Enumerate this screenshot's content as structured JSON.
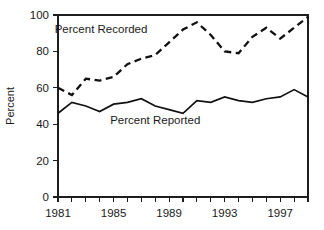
{
  "chart_data": {
    "type": "line",
    "title": "",
    "xlabel": "",
    "ylabel": "Percent",
    "xlim": [
      1981,
      1999
    ],
    "ylim": [
      0,
      100
    ],
    "grid": false,
    "legend_position": "inline-annotation",
    "x": [
      1981,
      1982,
      1983,
      1984,
      1985,
      1986,
      1987,
      1988,
      1989,
      1990,
      1991,
      1992,
      1993,
      1994,
      1995,
      1996,
      1997,
      1998,
      1999
    ],
    "y_ticks": [
      0,
      20,
      40,
      60,
      80,
      100
    ],
    "y_tick_labels": [
      "0",
      "20",
      "40",
      "60",
      "80",
      "100"
    ],
    "x_ticks": [
      1981,
      1982,
      1983,
      1984,
      1985,
      1986,
      1987,
      1988,
      1989,
      1990,
      1991,
      1992,
      1993,
      1994,
      1995,
      1996,
      1997,
      1998,
      1999
    ],
    "x_tick_labels": [
      "1981",
      "1985",
      "1989",
      "1993",
      "1997"
    ],
    "x_labeled_ticks": [
      1981,
      1985,
      1989,
      1993,
      1997
    ],
    "series": [
      {
        "name": "Percent Recorded",
        "style": "dashed",
        "color": "#111111",
        "label_text": "Percent Recorded",
        "values": [
          60,
          56,
          65,
          64,
          66,
          73,
          76,
          78,
          85,
          92,
          96,
          89,
          80,
          79,
          88,
          93,
          87,
          93,
          99
        ]
      },
      {
        "name": "Percent Reported",
        "style": "solid",
        "color": "#111111",
        "label_text": "Percent Reported",
        "values": [
          46,
          52,
          50,
          47,
          51,
          52,
          54,
          50,
          48,
          46,
          53,
          52,
          55,
          53,
          52,
          54,
          55,
          59,
          55
        ]
      }
    ],
    "annotations": [
      {
        "text": "Percent Recorded",
        "x": 1984.1,
        "y": 90
      },
      {
        "text": "Percent Reported",
        "x": 1988.0,
        "y": 40
      }
    ]
  }
}
